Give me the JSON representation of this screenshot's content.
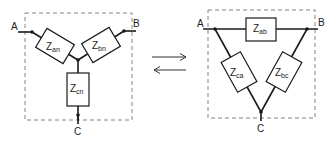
{
  "diagram": {
    "type": "wye-delta transformation",
    "wye": {
      "terminals": {
        "a": "A",
        "b": "B",
        "c": "C"
      },
      "impedances": [
        {
          "base": "Z",
          "sub": "an"
        },
        {
          "base": "Z",
          "sub": "bn"
        },
        {
          "base": "Z",
          "sub": "cn"
        }
      ]
    },
    "delta": {
      "terminals": {
        "a": "A",
        "b": "B",
        "c": "C"
      },
      "impedances": [
        {
          "base": "Z",
          "sub": "ab"
        },
        {
          "base": "Z",
          "sub": "ca"
        },
        {
          "base": "Z",
          "sub": "bc"
        }
      ]
    },
    "arrows": {
      "forward": "→",
      "backward": "←"
    },
    "colors": {
      "line": "#1a1a1a",
      "dashed_border": "#777777",
      "background": "#ffffff"
    }
  }
}
